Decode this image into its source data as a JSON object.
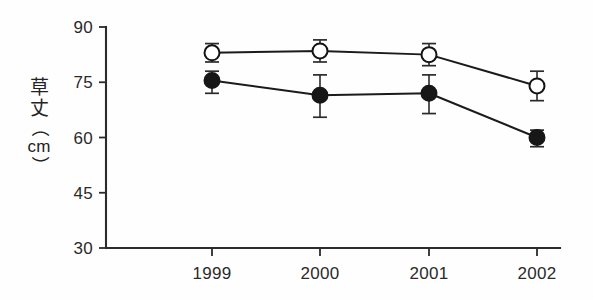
{
  "chart_data": {
    "type": "line",
    "title": "",
    "subtitle": "",
    "xlabel": "",
    "ylabel": "草丈（cm）",
    "ylabel_parts": {
      "char1": "草",
      "char2": "丈",
      "paren_open": "（",
      "unit": "cm",
      "paren_close": "）"
    },
    "categories": [
      "1999",
      "2000",
      "2001",
      "2002"
    ],
    "x": [
      1999,
      2000,
      2001,
      2002
    ],
    "ylim": [
      30,
      90
    ],
    "yticks": [
      30,
      45,
      60,
      75,
      90
    ],
    "ytick_labels": [
      "30",
      "45",
      "60",
      "75",
      "90"
    ],
    "xtick_labels": [
      "1999",
      "2000",
      "2001",
      "2002"
    ],
    "grid": false,
    "legend": "none",
    "legend_position": "none",
    "series": [
      {
        "name": "open-circle-series",
        "marker": "open-circle",
        "values": [
          83.0,
          83.5,
          82.5,
          74.0
        ],
        "err_upper": [
          85.5,
          86.5,
          85.5,
          78.0
        ],
        "err_lower": [
          80.5,
          80.5,
          79.5,
          70.0
        ]
      },
      {
        "name": "filled-circle-series",
        "marker": "filled-circle",
        "values": [
          75.5,
          71.5,
          72.0,
          60.0
        ],
        "err_upper": [
          78.0,
          77.0,
          77.0,
          62.0
        ],
        "err_lower": [
          72.0,
          65.5,
          66.5,
          57.5
        ]
      }
    ],
    "colors": {
      "axis": "#2b2b2b",
      "line": "#1b1b1b",
      "open_marker_fill": "#ffffff",
      "closed_marker_fill": "#171717",
      "background": "#fefefe"
    },
    "annotations": []
  },
  "geometry": {
    "plot_left": 106,
    "plot_right": 560,
    "plot_top": 27,
    "plot_bottom": 248,
    "x_positions": [
      212,
      320,
      429,
      537
    ],
    "marker_radius": 7.5,
    "cap_half_width": 7
  }
}
